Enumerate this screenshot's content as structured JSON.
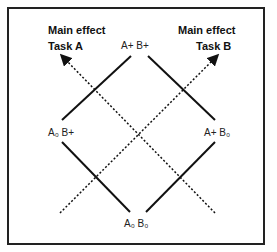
{
  "labels": {
    "main_effect_a_line1": "Main effect",
    "main_effect_a_line2": "Task A",
    "main_effect_b_line1": "Main effect",
    "main_effect_b_line2": "Task B",
    "top": "A+ B+",
    "left": "A₀ B+",
    "right": "A+ B₀",
    "bottom": "A₀ B₀"
  },
  "colors": {
    "line": "#111111",
    "frame": "#222222",
    "background": "#ffffff"
  }
}
